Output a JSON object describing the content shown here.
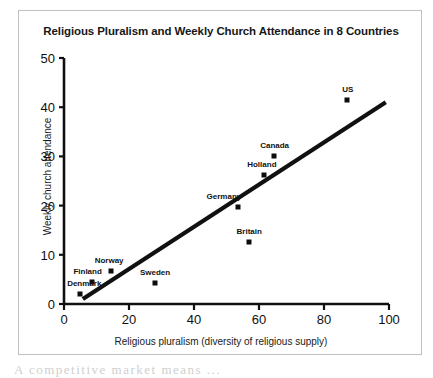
{
  "chart_data": {
    "type": "scatter",
    "title": "Religious Pluralism and Weekly Church Attendance in 8 Countries",
    "xlabel": "Religious pluralism (diversity of religious supply)",
    "ylabel": "Weekly church attendance",
    "xlim": [
      0,
      100
    ],
    "ylim": [
      0,
      50
    ],
    "xticks": [
      0,
      20,
      40,
      60,
      80,
      100
    ],
    "yticks": [
      0,
      10,
      20,
      30,
      40,
      50
    ],
    "xtick_labels": [
      "0",
      "20",
      "40",
      "60",
      "80",
      "100"
    ],
    "ytick_labels": [
      "0",
      "10",
      "20",
      "30",
      "40",
      "50"
    ],
    "grid": false,
    "legend": "none",
    "marker_color": "#0d0d0d",
    "line_color": "#111111",
    "points": [
      {
        "label": "Denmark",
        "x": 5,
        "y": 2,
        "label_dx": 4,
        "label_dy": -6
      },
      {
        "label": "Finland",
        "x": 8.5,
        "y": 4.5,
        "label_dx": -4,
        "label_dy": -6
      },
      {
        "label": "Norway",
        "x": 14.5,
        "y": 6.8,
        "label_dx": -2,
        "label_dy": -6
      },
      {
        "label": "Sweden",
        "x": 28,
        "y": 4.2,
        "label_dx": 0,
        "label_dy": -6
      },
      {
        "label": "Germany",
        "x": 53.5,
        "y": 19.8,
        "label_dx": -14,
        "label_dy": -6
      },
      {
        "label": "Britain",
        "x": 57,
        "y": 12.7,
        "label_dx": 0,
        "label_dy": -6
      },
      {
        "label": "Holland",
        "x": 61.5,
        "y": 26.2,
        "label_dx": -2,
        "label_dy": -6
      },
      {
        "label": "Canada",
        "x": 64.5,
        "y": 30,
        "label_dx": 1,
        "label_dy": -6
      },
      {
        "label": "US",
        "x": 87,
        "y": 41.5,
        "label_dx": 1,
        "label_dy": -6
      }
    ],
    "trendline": {
      "x0": 5.8,
      "y0": 1.0,
      "x1": 99,
      "y1": 41.0
    }
  },
  "page": {
    "bottom_text": "A  competitive  market  means  ..."
  }
}
